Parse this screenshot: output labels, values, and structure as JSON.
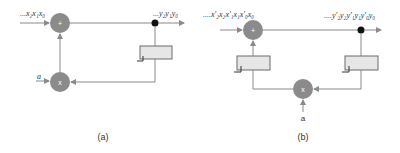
{
  "diagrams": [
    {
      "id": "a",
      "caption": "(a)",
      "input_label": "...x₂x₁x₀",
      "output_label": "...y₂y₁y₀",
      "coefficient_label": "a",
      "adder_symbol": "+",
      "multiplier_symbol": "x",
      "delay_count": 1
    },
    {
      "id": "b",
      "caption": "(b)",
      "input_label": "....x'₂x₂x'₁x₁x'₀x₀",
      "output_label": "....y'₂y₂y'₁y₁y'₀y₀",
      "coefficient_label": "a",
      "adder_symbol": "+",
      "multiplier_symbol": "x",
      "delay_count": 2
    }
  ],
  "colors": {
    "node_fill": "#8b8b8b",
    "wire": "#8a8a8a",
    "delay_fill": "#e6e6e6",
    "junction": "#111111"
  }
}
